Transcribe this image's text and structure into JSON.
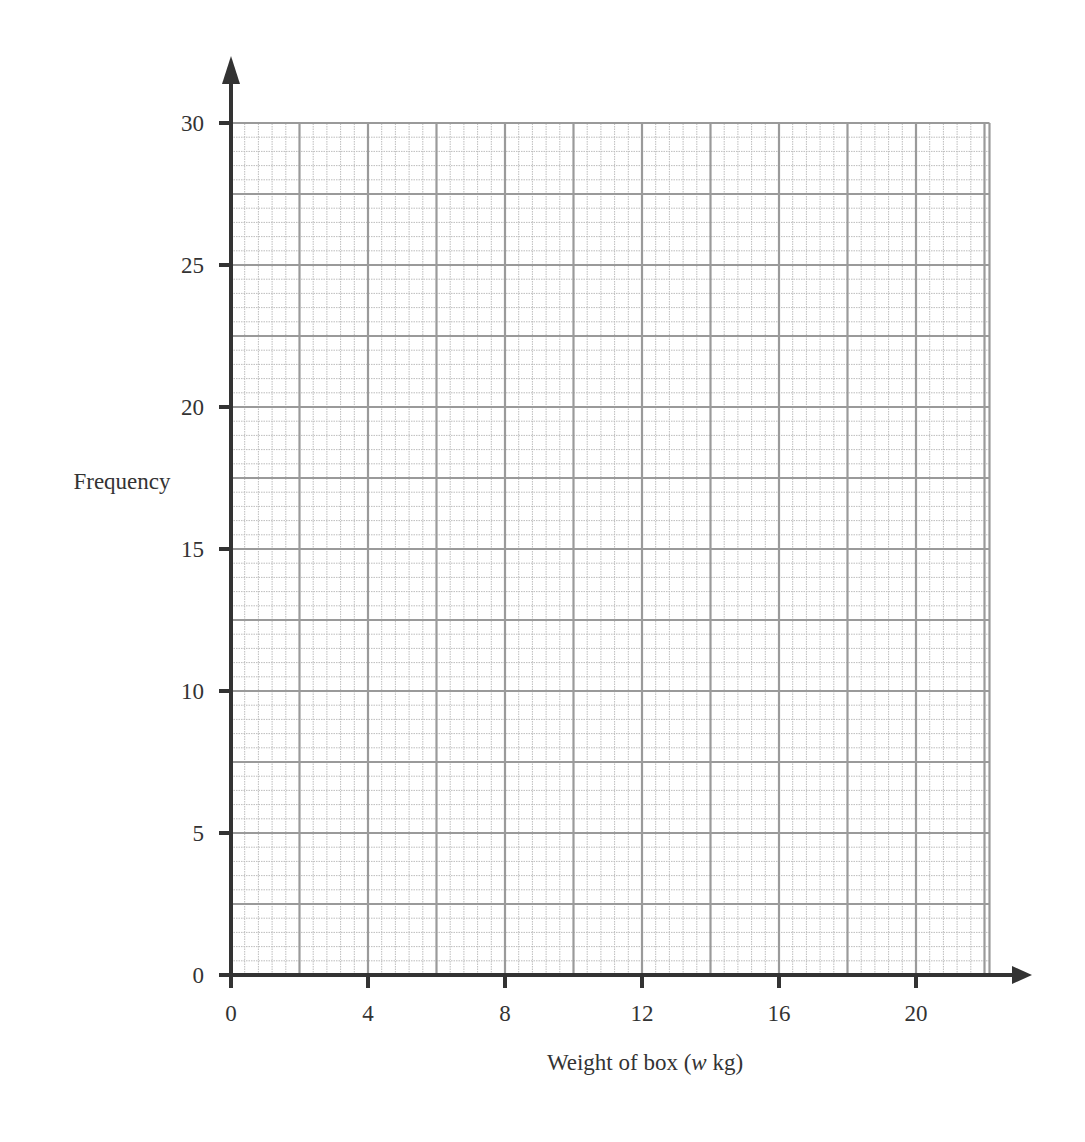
{
  "chart_data": {
    "type": "bar",
    "title": "",
    "xlabel": "Weight of box (w kg)",
    "xlabel_parts": [
      "Weight of box (",
      "w",
      " kg)"
    ],
    "ylabel": "Frequency",
    "xlim": [
      0,
      22
    ],
    "ylim": [
      0,
      30
    ],
    "x_ticks": [
      0,
      4,
      8,
      12,
      16,
      20
    ],
    "y_ticks": [
      0,
      5,
      10,
      15,
      20,
      25,
      30
    ],
    "grid": true,
    "grid_minor_x_step": 0.4,
    "grid_major_x_step": 2,
    "grid_minor_y_step": 0.5,
    "grid_major_y_step": 2.5,
    "series": [],
    "legend": null
  },
  "colors": {
    "axis": "#333333",
    "grid_major": "#9a9a9a",
    "grid_minor": "#bdbdbd",
    "text": "#333333"
  }
}
